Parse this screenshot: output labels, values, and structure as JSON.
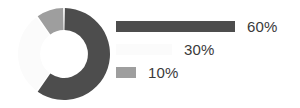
{
  "chart_data": {
    "type": "pie",
    "variant": "donut",
    "title": "",
    "subtitle": "",
    "xlabel": "",
    "ylabel": "",
    "grid": false,
    "legend_position": "right",
    "legend_style": "proportional-bars",
    "start_angle_deg": 0,
    "direction": "clockwise",
    "inner_radius_ratio": 0.52,
    "categories": [
      "60%",
      "30%",
      "10%"
    ],
    "values": [
      60,
      30,
      10
    ],
    "labels": [
      "60%",
      "30%",
      "10%"
    ],
    "colors": [
      "#4d4d4d",
      "#fbfbfb",
      "#9e9e9e"
    ],
    "slices": [
      {
        "label": "60%",
        "value": 60,
        "color": "#4d4d4d",
        "start_angle_deg": 0,
        "end_angle_deg": 216,
        "legend_bar_width_px": 119
      },
      {
        "label": "30%",
        "value": 30,
        "color": "#fbfbfb",
        "start_angle_deg": 216,
        "end_angle_deg": 324,
        "legend_bar_width_px": 56
      },
      {
        "label": "10%",
        "value": 10,
        "color": "#9e9e9e",
        "start_angle_deg": 324,
        "end_angle_deg": 360,
        "legend_bar_width_px": 20
      }
    ]
  },
  "style": {
    "background": "#ffffff",
    "text_color": "#3a3a3a",
    "slice_gap_color": "#ffffff"
  }
}
